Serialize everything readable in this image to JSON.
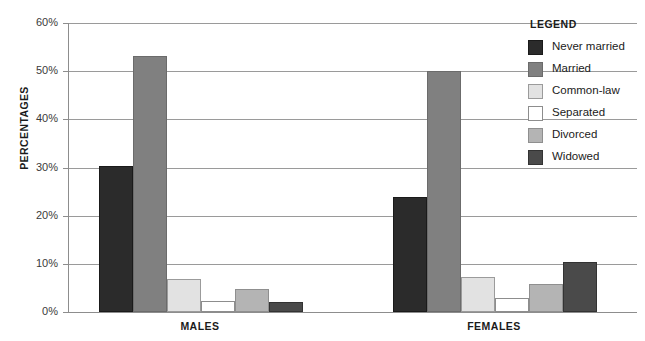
{
  "chart_data": {
    "type": "bar",
    "title": "",
    "xlabel": "",
    "ylabel": "PERCENTAGES",
    "ylim": [
      0,
      60
    ],
    "ytick_labels": [
      "0%",
      "10%",
      "20%",
      "30%",
      "40%",
      "50%",
      "60%"
    ],
    "ytick_values": [
      0,
      10,
      20,
      30,
      40,
      50,
      60
    ],
    "grid": true,
    "legend_position": "right",
    "legend_title": "LEGEND",
    "categories": [
      "MALES",
      "FEMALES"
    ],
    "series": [
      {
        "name": "Never married",
        "color": "#2b2b2b",
        "border": "#1a1a1a",
        "values": [
          30.3,
          23.9
        ]
      },
      {
        "name": "Married",
        "color": "#808080",
        "border": "#6b6b6b",
        "values": [
          53.2,
          50.0
        ]
      },
      {
        "name": "Common-law",
        "color": "#e2e2e2",
        "border": "#9b9b9b",
        "values": [
          6.9,
          7.3
        ]
      },
      {
        "name": "Separated",
        "color": "#ffffff",
        "border": "#8d8d8d",
        "values": [
          2.2,
          3.0
        ]
      },
      {
        "name": "Divorced",
        "color": "#b4b4b4",
        "border": "#8f8f8f",
        "values": [
          4.7,
          5.8
        ]
      },
      {
        "name": "Widowed",
        "color": "#4a4a4a",
        "border": "#333333",
        "values": [
          2.1,
          10.3
        ]
      }
    ]
  },
  "legend": {
    "title": "LEGEND",
    "items": [
      {
        "label": "Never married"
      },
      {
        "label": "Married"
      },
      {
        "label": "Common-law"
      },
      {
        "label": "Separated"
      },
      {
        "label": "Divorced"
      },
      {
        "label": "Widowed"
      }
    ]
  },
  "axis": {
    "y_title": "PERCENTAGES"
  }
}
